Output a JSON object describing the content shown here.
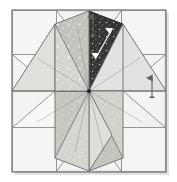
{
  "figure": {
    "title": "Eight-pointed star quilt block piecing diagram",
    "type": "quilt-block-diagram",
    "canvas": {
      "width": 177,
      "height": 182
    },
    "background_color": "#ffffff"
  },
  "block": {
    "name": "lemoyne-star-block",
    "frame": {
      "x": 12,
      "y": 10,
      "width": 154,
      "height": 162,
      "fill": "#f2f2f0",
      "stroke": "#6e6e6e",
      "stroke_width": 1.2
    },
    "center": {
      "x": 89,
      "y": 91
    },
    "background_pieces": {
      "corner_square_fill": "#f4f4f2",
      "side_triangle_fill": "#f4f4f2",
      "stroke": "#7a7a7a"
    },
    "star": {
      "point_count": 8,
      "piece_stroke": "#6b6b6b",
      "piece_stroke_width": 0.9,
      "diamonds": [
        {
          "name": "diamond-n",
          "position": "north",
          "half_a_fill": "#d6d6d2",
          "half_b_fill": "#c6c6c1",
          "texture": "speckle-light",
          "highlighted": false
        },
        {
          "name": "diamond-ne",
          "position": "north-east",
          "half_a_fill": "#2b2b2b",
          "half_b_fill": "#141414",
          "texture": "speckle-dark",
          "highlighted": true
        },
        {
          "name": "diamond-e",
          "position": "east",
          "half_a_fill": "#dedede",
          "half_b_fill": "#cacac6",
          "texture": "plain",
          "highlighted": false
        },
        {
          "name": "diamond-se",
          "position": "south-east",
          "half_a_fill": "#cfcfca",
          "half_b_fill": "#bdbdb8",
          "texture": "speckle-light",
          "highlighted": false
        },
        {
          "name": "diamond-s",
          "position": "south",
          "half_a_fill": "#dadad6",
          "half_b_fill": "#c8c8c3",
          "texture": "plain",
          "highlighted": false
        },
        {
          "name": "diamond-sw",
          "position": "south-west",
          "half_a_fill": "#d2d2ce",
          "half_b_fill": "#c0c0bb",
          "texture": "speckle-light",
          "highlighted": false
        },
        {
          "name": "diamond-w",
          "position": "west",
          "half_a_fill": "#dcdcd8",
          "half_b_fill": "#c9c9c4",
          "texture": "plain",
          "highlighted": false
        },
        {
          "name": "diamond-nw",
          "position": "north-west",
          "half_a_fill": "#d4d4d0",
          "half_b_fill": "#c3c3be",
          "texture": "speckle-light",
          "highlighted": false
        }
      ]
    }
  },
  "annotations": {
    "arrows": [
      {
        "name": "pressing-arrow-top",
        "direction": "up",
        "color": "#6a6a6a",
        "x": 93,
        "y_tail": 35,
        "y_head": 14
      },
      {
        "name": "pressing-arrow-right",
        "direction": "up",
        "color": "#6a6a6a",
        "x": 152,
        "y_tail": 97,
        "y_head": 75
      },
      {
        "name": "seam-arrow-dark-diamond",
        "direction": "double",
        "color": "#ffffff",
        "x1": 97,
        "y1": 56,
        "x2": 111,
        "y2": 30
      }
    ]
  }
}
